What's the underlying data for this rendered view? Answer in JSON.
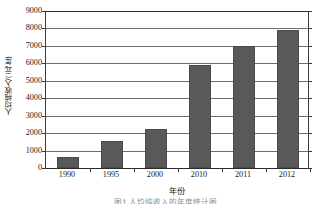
{
  "chart_data": {
    "type": "bar",
    "title": "",
    "subtitle": "",
    "xlabel": "年份",
    "ylabel": "人均纯收入/(元/年)",
    "categories": [
      "1990",
      "1995",
      "2000",
      "2010",
      "2011",
      "2012"
    ],
    "values": [
      650,
      1550,
      2250,
      5900,
      7000,
      7900
    ],
    "series": [
      {
        "name": "人均纯收入",
        "values": [
          650,
          1550,
          2250,
          5900,
          7000,
          7900
        ]
      }
    ],
    "ylim": [
      0,
      9000
    ],
    "ytick_step": 1000,
    "yticks": [
      "0",
      "1000",
      "2000",
      "3000",
      "4000",
      "5000",
      "6000",
      "7000",
      "8000",
      "9000"
    ],
    "grid": "horizontal",
    "legend": "none",
    "bar_color": "#595959",
    "gridline_color": "#6e6e6e",
    "axis_color": "#2b2b2b",
    "background": "#ffffff"
  },
  "caption": {
    "text": "图1  人均纯收入的年度统计图"
  }
}
